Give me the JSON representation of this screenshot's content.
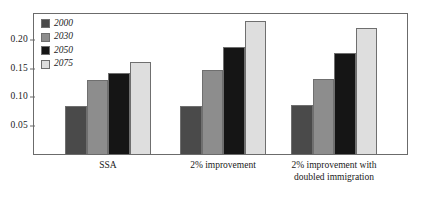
{
  "chart_data": {
    "type": "bar",
    "title": "",
    "subtitle": "",
    "xlabel": "",
    "ylabel": "",
    "categories": [
      "SSA",
      "2% improvement",
      "2% improvement with doubled immigration"
    ],
    "series": [
      {
        "name": "2000",
        "color": "#4a4a4a",
        "values": [
          0.085,
          0.085,
          0.086
        ]
      },
      {
        "name": "2030",
        "color": "#8d8d8d",
        "values": [
          0.13,
          0.148,
          0.132
        ]
      },
      {
        "name": "2050",
        "color": "#151515",
        "values": [
          0.142,
          0.188,
          0.178
        ]
      },
      {
        "name": "2075",
        "color": "#dedede",
        "values": [
          0.162,
          0.234,
          0.221
        ]
      }
    ],
    "ylim": [
      0.0,
      0.2465
    ],
    "yticks": [
      0.05,
      0.1,
      0.15,
      0.2
    ],
    "ytick_labels": [
      "0.05",
      "0.10",
      "0.15",
      "0.20"
    ],
    "grid": false,
    "legend_position": "top-left",
    "legend_entries": [
      "2000",
      "2030",
      "2050",
      "2075"
    ],
    "frame": true
  },
  "axis": {
    "tick_color": "#6b6b6b",
    "frame_color": "#6b6b6b"
  },
  "category_labels": [
    {
      "line1": "SSA",
      "line2": ""
    },
    {
      "line1": "2% improvement",
      "line2": ""
    },
    {
      "line1": "2% improvement with",
      "line2": "doubled immigration"
    }
  ]
}
